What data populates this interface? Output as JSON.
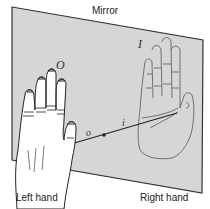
{
  "title": "Mirror",
  "labels": {
    "left_hand": "Left hand",
    "right_hand": "Right hand",
    "object_label": "O",
    "image_label": "I",
    "object_distance": "o",
    "image_distance": "i"
  },
  "colors": {
    "mirror_fill": "#d6d6d6",
    "mirror_edge": "#333333",
    "line": "#222222",
    "hand_fill": "#ffffff"
  }
}
